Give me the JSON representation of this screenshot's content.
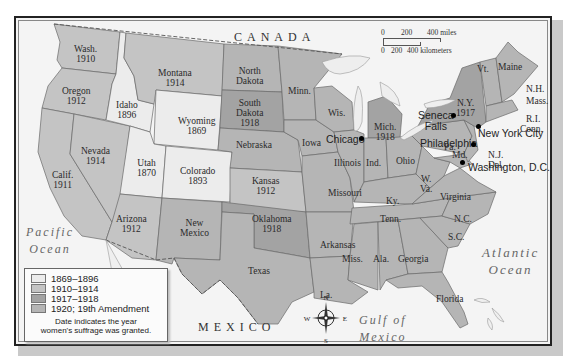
{
  "map": {
    "country_labels": {
      "canada": "CANADA",
      "mexico": "MEXICO"
    },
    "ocean_labels": {
      "pacific": [
        "Pacific",
        "Ocean"
      ],
      "atlantic": [
        "Atlantic",
        "Ocean"
      ],
      "gulf": [
        "Gulf of",
        "Mexico"
      ]
    },
    "lake_labels": {
      "superior": "Superior",
      "michigan": "L. Michigan",
      "huron": "Huron",
      "ontario": "L. Ontario"
    },
    "states": [
      {
        "name": "Wash.",
        "year": "1910",
        "period": "1910-1914"
      },
      {
        "name": "Oregon",
        "year": "1912",
        "period": "1910-1914"
      },
      {
        "name": "Calif.",
        "year": "1911",
        "period": "1910-1914"
      },
      {
        "name": "Idaho",
        "year": "1896",
        "period": "1869-1896"
      },
      {
        "name": "Nevada",
        "year": "1914",
        "period": "1910-1914"
      },
      {
        "name": "Montana",
        "year": "1914",
        "period": "1910-1914"
      },
      {
        "name": "Wyoming",
        "year": "1869",
        "period": "1869-1896"
      },
      {
        "name": "Utah",
        "year": "1870",
        "period": "1869-1896"
      },
      {
        "name": "Colorado",
        "year": "1893",
        "period": "1869-1896"
      },
      {
        "name": "Arizona",
        "year": "1912",
        "period": "1910-1914"
      },
      {
        "name": "New Mexico",
        "year": "",
        "period": "1920"
      },
      {
        "name": "North Dakota",
        "year": "",
        "period": "1920"
      },
      {
        "name": "South Dakota",
        "year": "1918",
        "period": "1917-1918"
      },
      {
        "name": "Nebraska",
        "year": "",
        "period": "1920"
      },
      {
        "name": "Kansas",
        "year": "1912",
        "period": "1910-1914"
      },
      {
        "name": "Oklahoma",
        "year": "1918",
        "period": "1917-1918"
      },
      {
        "name": "Texas",
        "year": "",
        "period": "1920"
      },
      {
        "name": "Minn.",
        "year": "",
        "period": "1920"
      },
      {
        "name": "Iowa",
        "year": "",
        "period": "1920"
      },
      {
        "name": "Missouri",
        "year": "",
        "period": "1920"
      },
      {
        "name": "Arkansas",
        "year": "",
        "period": "1920"
      },
      {
        "name": "La.",
        "year": "",
        "period": "1920"
      },
      {
        "name": "Wis.",
        "year": "",
        "period": "1920"
      },
      {
        "name": "Illinois",
        "year": "",
        "period": "1920"
      },
      {
        "name": "Mich.",
        "year": "1918",
        "period": "1917-1918"
      },
      {
        "name": "Ind.",
        "year": "",
        "period": "1920"
      },
      {
        "name": "Ohio",
        "year": "",
        "period": "1920"
      },
      {
        "name": "Ky.",
        "year": "",
        "period": "1920"
      },
      {
        "name": "Tenn.",
        "year": "",
        "period": "1920"
      },
      {
        "name": "Miss.",
        "year": "",
        "period": "1920"
      },
      {
        "name": "Ala.",
        "year": "",
        "period": "1920"
      },
      {
        "name": "Georgia",
        "year": "",
        "period": "1920"
      },
      {
        "name": "Florida",
        "year": "",
        "period": "1920"
      },
      {
        "name": "S.C.",
        "year": "",
        "period": "1920"
      },
      {
        "name": "N.C.",
        "year": "",
        "period": "1920"
      },
      {
        "name": "Virginia",
        "year": "",
        "period": "1920"
      },
      {
        "name": "W. Va.",
        "year": "",
        "period": "1920"
      },
      {
        "name": "Pa.",
        "year": "",
        "period": "1920"
      },
      {
        "name": "N.Y.",
        "year": "1917",
        "period": "1917-1918"
      },
      {
        "name": "Vt.",
        "year": "",
        "period": "1920"
      },
      {
        "name": "Maine",
        "year": "",
        "period": "1920"
      },
      {
        "name": "N.H.",
        "year": "",
        "period": "1920"
      },
      {
        "name": "Mass.",
        "year": "",
        "period": "1920"
      },
      {
        "name": "R.I.",
        "year": "",
        "period": "1920"
      },
      {
        "name": "Conn.",
        "year": "",
        "period": "1920"
      },
      {
        "name": "N.J.",
        "year": "",
        "period": "1920"
      },
      {
        "name": "Del.",
        "year": "",
        "period": "1920"
      },
      {
        "name": "Md.",
        "year": "",
        "period": "1920"
      }
    ],
    "cities": [
      {
        "name": "Chicago"
      },
      {
        "name": "Seneca Falls",
        "lines": [
          "Seneca",
          "Falls"
        ]
      },
      {
        "name": "Philadelphia"
      },
      {
        "name": "New York City"
      },
      {
        "name": "Washington, D.C."
      }
    ],
    "scale": {
      "miles_ticks": [
        "0",
        "200",
        "400 miles"
      ],
      "km_ticks": [
        "0",
        "200",
        "400 kilometers"
      ]
    },
    "compass": {
      "n": "N",
      "s": "S",
      "e": "E",
      "w": "W"
    }
  },
  "legend": {
    "items": [
      {
        "label": "1869–1896",
        "color": "#ececec"
      },
      {
        "label": "1910–1914",
        "color": "#c4c4c4"
      },
      {
        "label": "1917–1918",
        "color": "#a3a3a3"
      },
      {
        "label": "1920; 19th Amendment",
        "color": "#b5b5b5"
      }
    ],
    "note_lines": [
      "Date indicates the year",
      "women's suffrage was granted."
    ]
  },
  "colors": {
    "period_1869_1896": "#ececec",
    "period_1910_1914": "#c4c4c4",
    "period_1917_1918": "#a3a3a3",
    "period_1920": "#b5b5b5",
    "water": "#f4f4f4",
    "border": "#555555"
  }
}
